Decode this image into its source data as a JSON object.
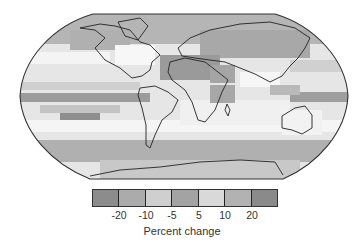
{
  "map": {
    "projection": "Robinson (world)",
    "description": "Global map of projected percent change in precipitation, grayscale shading",
    "regions_shaded": {
      "north_america_high_latitudes": "moderate increase",
      "northern_eurasia": "increase",
      "north_africa_mediterranean": "decrease",
      "equatorial_pacific": "strong increase band",
      "subtropical_south_pacific": "decrease",
      "southern_ocean": "increase",
      "australia": "mixed / slight decrease"
    }
  },
  "legend": {
    "title": "Percent change",
    "ticks": [
      "-20",
      "-10",
      "-5",
      "5",
      "10",
      "20"
    ],
    "swatches": [
      {
        "label": "< -20",
        "color": "#8c8c8c"
      },
      {
        "label": "-20 to -10",
        "color": "#ababab"
      },
      {
        "label": "-10 to -5",
        "color": "#cfcfcf"
      },
      {
        "label": "-5 to 5",
        "color": "#a3a3a3"
      },
      {
        "label": "5 to 10",
        "color": "#d9d9d9"
      },
      {
        "label": "10 to 20",
        "color": "#b2b2b2"
      },
      {
        "label": "> 20",
        "color": "#8a8a8a"
      }
    ]
  },
  "colors": {
    "ocean_light": "#f2f2f2",
    "land_mid": "#bdbdbd",
    "dark": "#8e8e8e",
    "coastline": "#222222"
  }
}
